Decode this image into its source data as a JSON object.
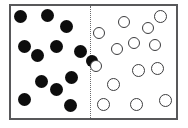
{
  "figure": {
    "type": "particle-distribution-diagram",
    "width": 188,
    "height": 128,
    "background_color": "#ffffff"
  },
  "container": {
    "label": "container-box",
    "x": 9,
    "y": 4,
    "width": 169,
    "height": 116,
    "border_color": "#58585a",
    "border_width": 2,
    "fill_color": "#ffffff"
  },
  "divider": {
    "label": "dotted-divider",
    "orientation": "vertical",
    "x": 90,
    "y_top": 6,
    "y_bottom": 118,
    "style": "dotted",
    "color": "#6b6b6d",
    "width": 1
  },
  "legend": {
    "left_region_label": "filled-particles",
    "right_region_label": "open-particles",
    "filled_color": "#0d0d0d",
    "open_fill_color": "#ffffff",
    "open_stroke_color": "#3c3c3e",
    "filled_count": 13,
    "open_count": 14
  },
  "particles": {
    "filled": [
      {
        "cx": 20,
        "cy": 16,
        "r": 6.5
      },
      {
        "cx": 47,
        "cy": 15,
        "r": 6.5
      },
      {
        "cx": 66,
        "cy": 26,
        "r": 6.5
      },
      {
        "cx": 24,
        "cy": 46,
        "r": 6.5
      },
      {
        "cx": 56,
        "cy": 46,
        "r": 6.5
      },
      {
        "cx": 37,
        "cy": 55,
        "r": 6.5
      },
      {
        "cx": 80,
        "cy": 51,
        "r": 6.5
      },
      {
        "cx": 41,
        "cy": 81,
        "r": 6.5
      },
      {
        "cx": 71,
        "cy": 77,
        "r": 6.5
      },
      {
        "cx": 56,
        "cy": 89,
        "r": 6.5
      },
      {
        "cx": 24,
        "cy": 99,
        "r": 6.5
      },
      {
        "cx": 70,
        "cy": 105,
        "r": 6.5
      },
      {
        "cx": 92,
        "cy": 61,
        "r": 6.0
      }
    ],
    "open": [
      {
        "cx": 99,
        "cy": 33,
        "r": 6.0
      },
      {
        "cx": 124,
        "cy": 22,
        "r": 6.0
      },
      {
        "cx": 160,
        "cy": 16,
        "r": 6.5
      },
      {
        "cx": 117,
        "cy": 49,
        "r": 6.0
      },
      {
        "cx": 134,
        "cy": 43,
        "r": 6.0
      },
      {
        "cx": 155,
        "cy": 45,
        "r": 6.0
      },
      {
        "cx": 138,
        "cy": 70,
        "r": 6.5
      },
      {
        "cx": 157,
        "cy": 68,
        "r": 6.5
      },
      {
        "cx": 113,
        "cy": 84,
        "r": 6.5
      },
      {
        "cx": 103,
        "cy": 104,
        "r": 6.5
      },
      {
        "cx": 136,
        "cy": 104,
        "r": 6.5
      },
      {
        "cx": 165,
        "cy": 100,
        "r": 6.5
      },
      {
        "cx": 96,
        "cy": 66,
        "r": 6.0
      },
      {
        "cx": 148,
        "cy": 28,
        "r": 6.0
      }
    ]
  }
}
